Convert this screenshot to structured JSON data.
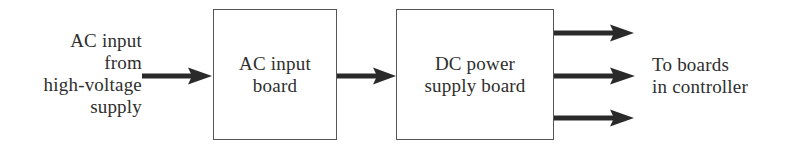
{
  "diagram": {
    "type": "block-diagram",
    "input_label": {
      "lines": [
        "AC input",
        "from",
        "high-voltage",
        "supply"
      ]
    },
    "blocks": [
      {
        "id": "ac-input-board",
        "lines": [
          "AC input",
          "board"
        ]
      },
      {
        "id": "dc-power-supply-board",
        "lines": [
          "DC power",
          "supply board"
        ]
      }
    ],
    "output_label": {
      "lines": [
        "To boards",
        "in controller"
      ]
    },
    "connections": [
      {
        "from": "input",
        "to": "ac-input-board"
      },
      {
        "from": "ac-input-board",
        "to": "dc-power-supply-board"
      },
      {
        "from": "dc-power-supply-board",
        "to": "output",
        "count": 3
      }
    ],
    "colors": {
      "line": "#555555",
      "arrow": "#2a2a2a",
      "text": "#2e2e2e",
      "background": "#ffffff"
    }
  }
}
